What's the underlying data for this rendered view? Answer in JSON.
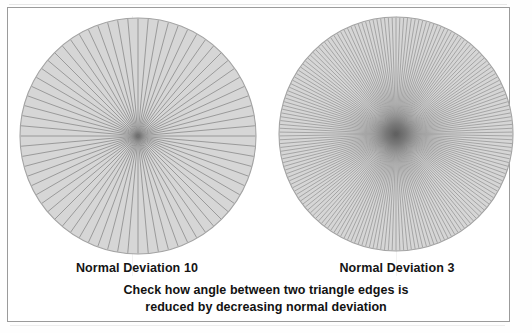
{
  "figure": {
    "note_line_1": "Check how angle between two triangle edges is",
    "note_line_2": "reduced by decreasing normal deviation"
  },
  "colors": {
    "frame_border": "#9b9b9b",
    "page_background": "#ffffff",
    "disc_fill": "#d6d6d6",
    "disc_outline": "#a3a3a3",
    "spoke_line": "#8f8f8f",
    "center_smudge": "#6f6f6f",
    "caption_text": "#121212"
  },
  "panels": [
    {
      "id": "left",
      "caption": "Normal Deviation 10",
      "deviation": 10,
      "spoke_count": 72,
      "center_x": 124,
      "center_y": 124,
      "radius": 118,
      "spoke_width": 0.85
    },
    {
      "id": "right",
      "caption": "Normal Deviation 3",
      "deviation": 3,
      "spoke_count": 190,
      "center_x": 124,
      "center_y": 122,
      "radius": 117,
      "spoke_width": 0.7
    }
  ],
  "chart_data": {
    "type": "pie",
    "subtitle": "Check how angle between two triangle edges is reduced by decreasing normal deviation",
    "xlabel": "",
    "ylabel": "",
    "legend_position": "none",
    "grid": false,
    "series": [
      {
        "name": "Normal Deviation 10",
        "segments": 72,
        "segment_angle_degrees": 5,
        "values": [
          1,
          1,
          1,
          1,
          1,
          1,
          1,
          1,
          1,
          1,
          1,
          1,
          1,
          1,
          1,
          1,
          1,
          1,
          1,
          1,
          1,
          1,
          1,
          1,
          1,
          1,
          1,
          1,
          1,
          1,
          1,
          1,
          1,
          1,
          1,
          1,
          1,
          1,
          1,
          1,
          1,
          1,
          1,
          1,
          1,
          1,
          1,
          1,
          1,
          1,
          1,
          1,
          1,
          1,
          1,
          1,
          1,
          1,
          1,
          1,
          1,
          1,
          1,
          1,
          1,
          1,
          1,
          1,
          1,
          1,
          1,
          1
        ]
      },
      {
        "name": "Normal Deviation 3",
        "segments": 190,
        "segment_angle_degrees": 1.89,
        "values": []
      }
    ],
    "annotations": [
      "Normal Deviation 10",
      "Normal Deviation 3",
      "Check how angle between two triangle edges is",
      "reduced by decreasing normal deviation"
    ]
  }
}
